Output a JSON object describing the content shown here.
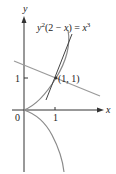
{
  "figure": {
    "equation": {
      "base": "y",
      "exp": "2",
      "mid": "(2 − ",
      "x": "x",
      "close": ") = ",
      "rhs": "x",
      "rhs_exp": "3"
    },
    "axes": {
      "x_label": "x",
      "y_label": "y",
      "origin_label": "0",
      "x_tick_label": "1",
      "y_tick_label": "1"
    },
    "point_label": "(1, 1)",
    "colors": {
      "axis": "#333333",
      "curve": "#8a8a8a",
      "tangent": "#9a9a9a",
      "steep_line": "#444444"
    }
  }
}
